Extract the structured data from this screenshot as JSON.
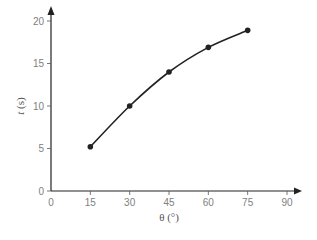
{
  "chart_data": {
    "type": "line",
    "title": "",
    "xlabel": "θ (°)",
    "ylabel": "t (s)",
    "xlim": [
      0,
      90
    ],
    "ylim": [
      0,
      20
    ],
    "x_ticks": [
      0,
      15,
      30,
      45,
      60,
      75,
      90
    ],
    "y_ticks": [
      0,
      5,
      10,
      15,
      20
    ],
    "grid": false,
    "legend": null,
    "series": [
      {
        "name": "t vs θ",
        "x": [
          15,
          30,
          45,
          60,
          75
        ],
        "y": [
          5.2,
          10,
          14,
          16.9,
          18.9
        ],
        "marker": "circle",
        "smooth": true,
        "color": "#222222"
      }
    ]
  },
  "labels": {
    "x_axis": "θ (°)",
    "y_axis_italic": "t",
    "y_axis_unit": " (s)"
  }
}
